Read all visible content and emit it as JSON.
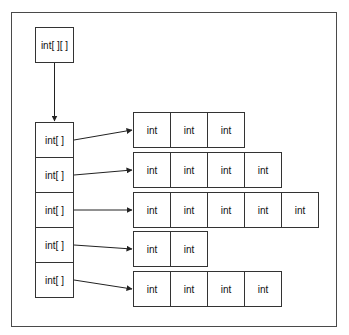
{
  "diagram": {
    "top_box": {
      "label": "int[ ][ ]"
    },
    "column": [
      {
        "label": "int[ ]"
      },
      {
        "label": "int[ ]"
      },
      {
        "label": "int[ ]"
      },
      {
        "label": "int[ ]"
      },
      {
        "label": "int[ ]"
      }
    ],
    "rows": [
      {
        "cells": [
          "int",
          "int",
          "int"
        ]
      },
      {
        "cells": [
          "int",
          "int",
          "int",
          "int"
        ]
      },
      {
        "cells": [
          "int",
          "int",
          "int",
          "int",
          "int"
        ]
      },
      {
        "cells": [
          "int",
          "int"
        ]
      },
      {
        "cells": [
          "int",
          "int",
          "int",
          "int"
        ]
      }
    ],
    "colors": {
      "line": "#333333",
      "background": "#ffffff"
    }
  }
}
